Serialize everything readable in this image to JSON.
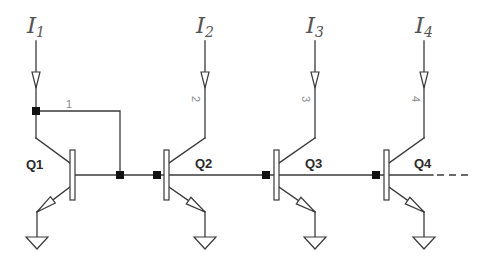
{
  "diagram": {
    "type": "circuit-schematic",
    "currents": [
      {
        "main": "I",
        "sub": "1"
      },
      {
        "main": "I",
        "sub": "2"
      },
      {
        "main": "I",
        "sub": "3"
      },
      {
        "main": "I",
        "sub": "4"
      }
    ],
    "transistors": [
      {
        "label": "Q1"
      },
      {
        "label": "Q2"
      },
      {
        "label": "Q3"
      },
      {
        "label": "Q4"
      }
    ],
    "wire_labels": [
      "1",
      "2",
      "3",
      "4"
    ],
    "continuation": "dashed base line continues to the right"
  },
  "colors": {
    "wire": "#3a3a3a",
    "node": "#111111",
    "current_label": "#555555",
    "wire_label": "#8a8a8a",
    "transistor_label": "#2a2a2a"
  }
}
